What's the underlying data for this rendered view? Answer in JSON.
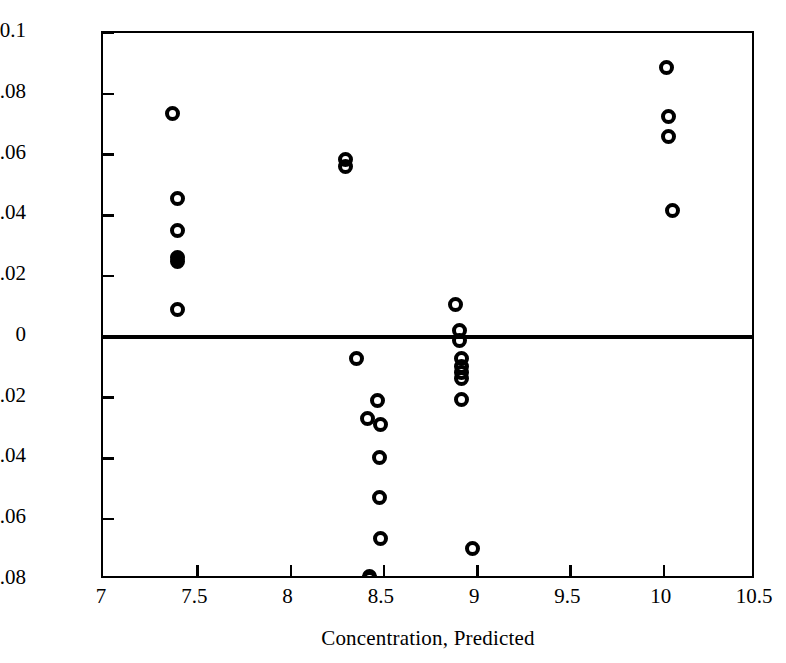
{
  "chart_data": {
    "type": "scatter",
    "title": "",
    "xlabel": "Concentration, Predicted",
    "ylabel": "Concentration, Residual",
    "xlim": [
      7,
      10.5
    ],
    "ylim": [
      -0.08,
      0.1
    ],
    "xticks": [
      "7",
      "7.5",
      "8",
      "8.5",
      "9",
      "9.5",
      "10",
      "10.5"
    ],
    "xtick_values": [
      7,
      7.5,
      8,
      8.5,
      9,
      9.5,
      10,
      10.5
    ],
    "yticks": [
      "0.1",
      "0.08",
      "0.06",
      "0.04",
      "0.02",
      "0",
      "-0.02",
      "-0.04",
      "-0.06",
      "-0.08"
    ],
    "ytick_values": [
      0.1,
      0.08,
      0.06,
      0.04,
      0.02,
      0,
      -0.02,
      -0.04,
      -0.06,
      -0.08
    ],
    "grid": false,
    "legend": null,
    "reference_lines": [
      {
        "name": "zero-residual-line",
        "orientation": "horizontal",
        "y": 0,
        "color": "#000000"
      }
    ],
    "marker_style": "open-circle",
    "marker_color": "#000000",
    "points": [
      {
        "x": 7.37,
        "y": 0.0735,
        "filled": false
      },
      {
        "x": 7.4,
        "y": 0.0455,
        "filled": false
      },
      {
        "x": 7.4,
        "y": 0.035,
        "filled": false
      },
      {
        "x": 7.4,
        "y": 0.0262,
        "filled": true
      },
      {
        "x": 7.4,
        "y": 0.0248,
        "filled": true
      },
      {
        "x": 7.4,
        "y": 0.009,
        "filled": false
      },
      {
        "x": 8.3,
        "y": 0.0585,
        "filled": false
      },
      {
        "x": 8.3,
        "y": 0.056,
        "filled": false
      },
      {
        "x": 8.36,
        "y": -0.007,
        "filled": false
      },
      {
        "x": 8.47,
        "y": -0.0208,
        "filled": false
      },
      {
        "x": 8.42,
        "y": -0.0268,
        "filled": false
      },
      {
        "x": 8.49,
        "y": -0.0288,
        "filled": false
      },
      {
        "x": 8.48,
        "y": -0.0398,
        "filled": false
      },
      {
        "x": 8.48,
        "y": -0.0528,
        "filled": false
      },
      {
        "x": 8.49,
        "y": -0.0662,
        "filled": false
      },
      {
        "x": 8.43,
        "y": -0.0788,
        "filled": false
      },
      {
        "x": 8.43,
        "y": -0.0795,
        "filled": false
      },
      {
        "x": 8.89,
        "y": 0.0105,
        "filled": false
      },
      {
        "x": 8.91,
        "y": 0.0022,
        "filled": false
      },
      {
        "x": 8.91,
        "y": -0.0012,
        "filled": false
      },
      {
        "x": 8.92,
        "y": -0.0072,
        "filled": false
      },
      {
        "x": 8.92,
        "y": -0.0098,
        "filled": false
      },
      {
        "x": 8.92,
        "y": -0.0118,
        "filled": false
      },
      {
        "x": 8.92,
        "y": -0.0136,
        "filled": false
      },
      {
        "x": 8.92,
        "y": -0.0205,
        "filled": false
      },
      {
        "x": 8.98,
        "y": -0.0695,
        "filled": false
      },
      {
        "x": 10.02,
        "y": 0.0885,
        "filled": false
      },
      {
        "x": 10.03,
        "y": 0.0725,
        "filled": false
      },
      {
        "x": 10.03,
        "y": 0.066,
        "filled": false
      },
      {
        "x": 10.05,
        "y": 0.0415,
        "filled": false
      }
    ]
  }
}
